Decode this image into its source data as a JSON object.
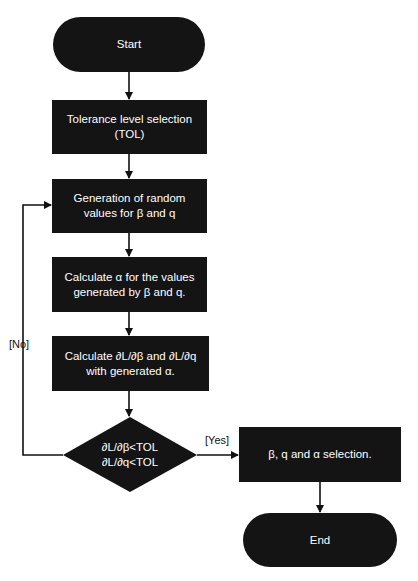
{
  "diagram": {
    "type": "flowchart",
    "colors": {
      "node_fill": "#141414",
      "node_text": "#ffffff",
      "edge": "#111111",
      "background": "#ffffff"
    },
    "nodes": {
      "start": {
        "shape": "terminator",
        "label": "Start"
      },
      "tol": {
        "shape": "process",
        "line1": "Tolerance level selection",
        "line2": "(TOL)"
      },
      "generate": {
        "shape": "process",
        "line1": "Generation of random",
        "line2": "values for β and q"
      },
      "alpha": {
        "shape": "process",
        "line1": "Calculate α for the values",
        "line2": "generated by β and q."
      },
      "derivs": {
        "shape": "process",
        "line1": "Calculate ∂L/∂β and ∂L/∂q",
        "line2": "with generated α."
      },
      "decision": {
        "shape": "decision",
        "line1": "∂L/∂β<TOL",
        "line2": "∂L/∂q<TOL"
      },
      "select": {
        "shape": "process",
        "label": "β, q and α selection."
      },
      "end": {
        "shape": "terminator",
        "label": "End"
      }
    },
    "edges": [
      {
        "from": "start",
        "to": "tol",
        "label": ""
      },
      {
        "from": "tol",
        "to": "generate",
        "label": ""
      },
      {
        "from": "generate",
        "to": "alpha",
        "label": ""
      },
      {
        "from": "alpha",
        "to": "derivs",
        "label": ""
      },
      {
        "from": "derivs",
        "to": "decision",
        "label": ""
      },
      {
        "from": "decision",
        "to": "generate",
        "label": "[No]"
      },
      {
        "from": "decision",
        "to": "select",
        "label": "[Yes]"
      },
      {
        "from": "select",
        "to": "end",
        "label": ""
      }
    ],
    "edge_labels": {
      "no": "[No]",
      "yes": "[Yes]"
    }
  }
}
